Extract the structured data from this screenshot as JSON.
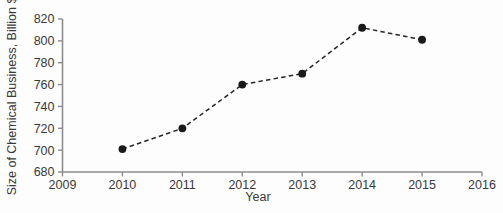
{
  "chart_data": {
    "type": "line",
    "title": "",
    "subtitle": "",
    "xlabel": "Year",
    "ylabel": "Size of Chemical Business, Billion $",
    "x": [
      2010,
      2011,
      2012,
      2013,
      2014,
      2015
    ],
    "values": [
      701,
      720,
      760,
      770,
      812,
      801
    ],
    "series": [
      {
        "name": "Size of Chemical Business",
        "x": [
          2010,
          2011,
          2012,
          2013,
          2014,
          2015
        ],
        "values": [
          701,
          720,
          760,
          770,
          812,
          801
        ]
      }
    ],
    "xlim": [
      2009,
      2016
    ],
    "ylim": [
      680,
      820
    ],
    "xticks": [
      "2009",
      "2010",
      "2011",
      "2012",
      "2013",
      "2014",
      "2015",
      "2016"
    ],
    "yticks": [
      "680",
      "700",
      "720",
      "740",
      "760",
      "780",
      "800",
      "820"
    ],
    "grid": false,
    "legend": false,
    "legend_position": "none",
    "line_style": "dashed",
    "marker": "filled-circle",
    "colors": {
      "line": "#262626",
      "marker": "#1a1a1a",
      "axis": "#8c8c8c",
      "text": "#3a3a3a",
      "background": "#fdfdfd"
    }
  },
  "axes": {
    "y_title": "Size of Chemical Business, Billion $",
    "x_title": "Year",
    "y_ticks": [
      {
        "label": "820",
        "value": 820
      },
      {
        "label": "800",
        "value": 800
      },
      {
        "label": "780",
        "value": 780
      },
      {
        "label": "760",
        "value": 760
      },
      {
        "label": "740",
        "value": 740
      },
      {
        "label": "720",
        "value": 720
      },
      {
        "label": "700",
        "value": 700
      },
      {
        "label": "680",
        "value": 680
      }
    ],
    "x_ticks": [
      {
        "label": "2009",
        "value": 2009
      },
      {
        "label": "2010",
        "value": 2010
      },
      {
        "label": "2011",
        "value": 2011
      },
      {
        "label": "2012",
        "value": 2012
      },
      {
        "label": "2013",
        "value": 2013
      },
      {
        "label": "2014",
        "value": 2014
      },
      {
        "label": "2015",
        "value": 2015
      },
      {
        "label": "2016",
        "value": 2016
      }
    ]
  },
  "points": [
    {
      "year": "2010",
      "value": "701"
    },
    {
      "year": "2011",
      "value": "720"
    },
    {
      "year": "2012",
      "value": "760"
    },
    {
      "year": "2013",
      "value": "770"
    },
    {
      "year": "2014",
      "value": "812"
    },
    {
      "year": "2015",
      "value": "801"
    }
  ]
}
